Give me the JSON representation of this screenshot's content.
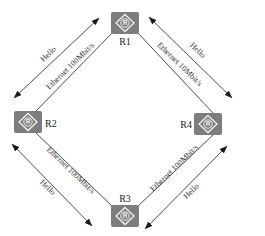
{
  "diagram": {
    "type": "network-topology",
    "shape": "diamond-ring",
    "colors": {
      "router_fill": "#7d7d7d",
      "router_icon": "#f2f2f2",
      "line": "#3a3a3a",
      "text": "#333333",
      "background": "#ffffff"
    },
    "routers": [
      {
        "id": "R1",
        "label": "R1",
        "icon_glyph": "R",
        "position": "top"
      },
      {
        "id": "R2",
        "label": "R2",
        "icon_glyph": "R",
        "position": "left"
      },
      {
        "id": "R3",
        "label": "R3",
        "icon_glyph": "R",
        "position": "bottom"
      },
      {
        "id": "R4",
        "label": "R4",
        "icon_glyph": "R",
        "position": "right"
      }
    ],
    "links": [
      {
        "from": "R2",
        "to": "R1",
        "medium_label": "Ethernet 100Mbit/s",
        "hello_label": "Hello",
        "hello_arrow": "bidirectional"
      },
      {
        "from": "R1",
        "to": "R4",
        "medium_label": "Ethernet 10Mbit/s",
        "hello_label": "Hello",
        "hello_arrow": "bidirectional"
      },
      {
        "from": "R2",
        "to": "R3",
        "medium_label": "Ethernet 100Mbit/s",
        "hello_label": "Hello",
        "hello_arrow": "bidirectional"
      },
      {
        "from": "R3",
        "to": "R4",
        "medium_label": "Ethernet 100Mbit/s",
        "hello_label": "Hello",
        "hello_arrow": "bidirectional"
      }
    ]
  }
}
